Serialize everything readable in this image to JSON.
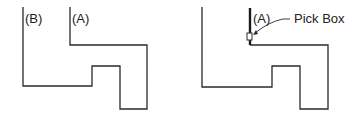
{
  "figures": [
    {
      "id": "left",
      "labels": {
        "b": "(B)",
        "a": "(A)"
      }
    },
    {
      "id": "right",
      "labels": {
        "a": "(A)",
        "pickbox": "Pick Box"
      }
    }
  ],
  "colors": {
    "line": "#2a2a2a"
  }
}
